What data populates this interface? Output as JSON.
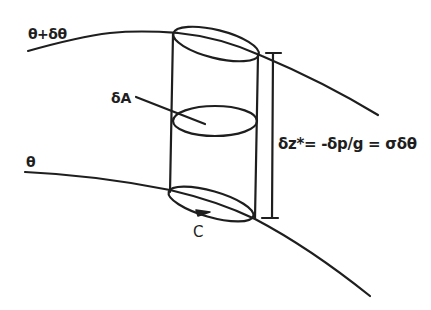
{
  "figure": {
    "type": "isentropic-layer-column-diagram",
    "labels": {
      "upper_surface": "θ+δθ",
      "lower_surface": "θ",
      "area": "δA",
      "thickness_equation": "δz*= -δp/g = σδθ",
      "circuit": "C"
    },
    "colors": {
      "stroke": "#1e1e1e",
      "background": "#ffffff"
    }
  }
}
